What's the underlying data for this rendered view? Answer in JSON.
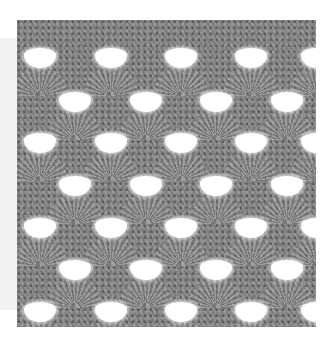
{
  "image": {
    "subject": "crochet-shell-stitch-swatch",
    "description": "Gray crochet swatch with fan/shell stitch pattern and white triangular openings",
    "colors": {
      "yarn": "#8a8a8a",
      "yarn_dark": "#5a5a5a",
      "holes": "#ffffff",
      "page_background": "#ffffff",
      "side_panel": "#f2f2f2"
    },
    "rows": [
      {
        "y": 28,
        "holes_x": [
          23,
          94,
          164,
          234,
          300
        ]
      },
      {
        "y": 72,
        "holes_x": [
          58,
          129,
          199,
          270
        ]
      },
      {
        "y": 113,
        "holes_x": [
          23,
          94,
          164,
          234,
          300
        ]
      },
      {
        "y": 156,
        "holes_x": [
          58,
          129,
          199,
          270
        ]
      },
      {
        "y": 198,
        "holes_x": [
          23,
          94,
          164,
          234,
          300
        ]
      },
      {
        "y": 240,
        "holes_x": [
          58,
          129,
          199,
          270
        ]
      },
      {
        "y": 282,
        "holes_x": [
          23,
          94,
          164,
          234,
          300
        ]
      }
    ]
  }
}
